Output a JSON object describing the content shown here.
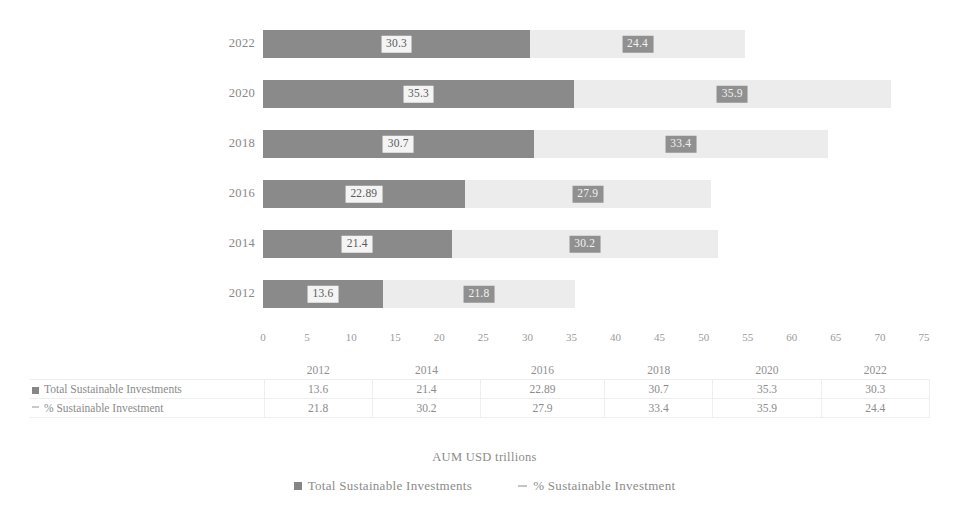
{
  "chart_data": {
    "type": "bar",
    "orientation": "horizontal",
    "stacked": true,
    "title": "",
    "xlabel": "AUM USD trillions",
    "ylabel": "",
    "xlim": [
      0,
      75
    ],
    "xticks": [
      0,
      5,
      10,
      15,
      20,
      25,
      30,
      35,
      40,
      45,
      50,
      55,
      60,
      65,
      70,
      75
    ],
    "grid": false,
    "legend_position": "bottom",
    "categories": [
      "2022",
      "2020",
      "2018",
      "2016",
      "2014",
      "2012"
    ],
    "categories_ascending": [
      "2012",
      "2014",
      "2016",
      "2018",
      "2020",
      "2022"
    ],
    "series": [
      {
        "name": "Total Sustainable Investments",
        "color": "#8a8a8a",
        "marker": "square",
        "values_by_year": [
          13.6,
          21.4,
          22.89,
          30.7,
          35.3,
          30.3
        ],
        "values_plot_order": [
          30.3,
          35.3,
          30.7,
          22.89,
          21.4,
          13.6
        ]
      },
      {
        "name": "% Sustainable Investment",
        "color": "#ececec",
        "marker": "line",
        "values_by_year": [
          21.8,
          30.2,
          27.9,
          33.4,
          35.9,
          24.4
        ],
        "values_plot_order": [
          24.4,
          35.9,
          33.4,
          27.9,
          30.2,
          21.8
        ]
      }
    ]
  },
  "axis_title": "AUM USD trillions",
  "x_axis": {
    "ticks": [
      "0",
      "5",
      "10",
      "15",
      "20",
      "25",
      "30",
      "35",
      "40",
      "45",
      "50",
      "55",
      "60",
      "65",
      "70",
      "75"
    ]
  },
  "y_axis": {
    "labels": [
      "2022",
      "2020",
      "2018",
      "2016",
      "2014",
      "2012"
    ]
  },
  "bars": [
    {
      "year": "2022",
      "primary": "30.3",
      "secondary": "24.4"
    },
    {
      "year": "2020",
      "primary": "35.3",
      "secondary": "35.9"
    },
    {
      "year": "2018",
      "primary": "30.7",
      "secondary": "33.4"
    },
    {
      "year": "2016",
      "primary": "22.89",
      "secondary": "27.9"
    },
    {
      "year": "2014",
      "primary": "21.4",
      "secondary": "30.2"
    },
    {
      "year": "2012",
      "primary": "13.6",
      "secondary": "21.8"
    }
  ],
  "table": {
    "corner": "",
    "columns": [
      "2012",
      "2014",
      "2016",
      "2018",
      "2020",
      "2022"
    ],
    "rows": [
      {
        "label": "Total Sustainable Investments",
        "marker": "square",
        "values": [
          "13.6",
          "21.4",
          "22.89",
          "30.7",
          "35.3",
          "30.3"
        ]
      },
      {
        "label": "% Sustainable Investment",
        "marker": "line",
        "values": [
          "21.8",
          "30.2",
          "27.9",
          "33.4",
          "35.9",
          "24.4"
        ]
      }
    ]
  },
  "legend": {
    "items": [
      {
        "label": "Total Sustainable Investments",
        "marker": "square",
        "color": "#858585"
      },
      {
        "label": "% Sustainable Investment",
        "marker": "line",
        "color": "#c4c4c4"
      }
    ]
  },
  "colors": {
    "primary_series": "#8a8a8a",
    "secondary_series": "#ececec",
    "text": "#8b8b8b",
    "label_box_light": "#f4f4f4",
    "label_box_dark": "#909090"
  }
}
